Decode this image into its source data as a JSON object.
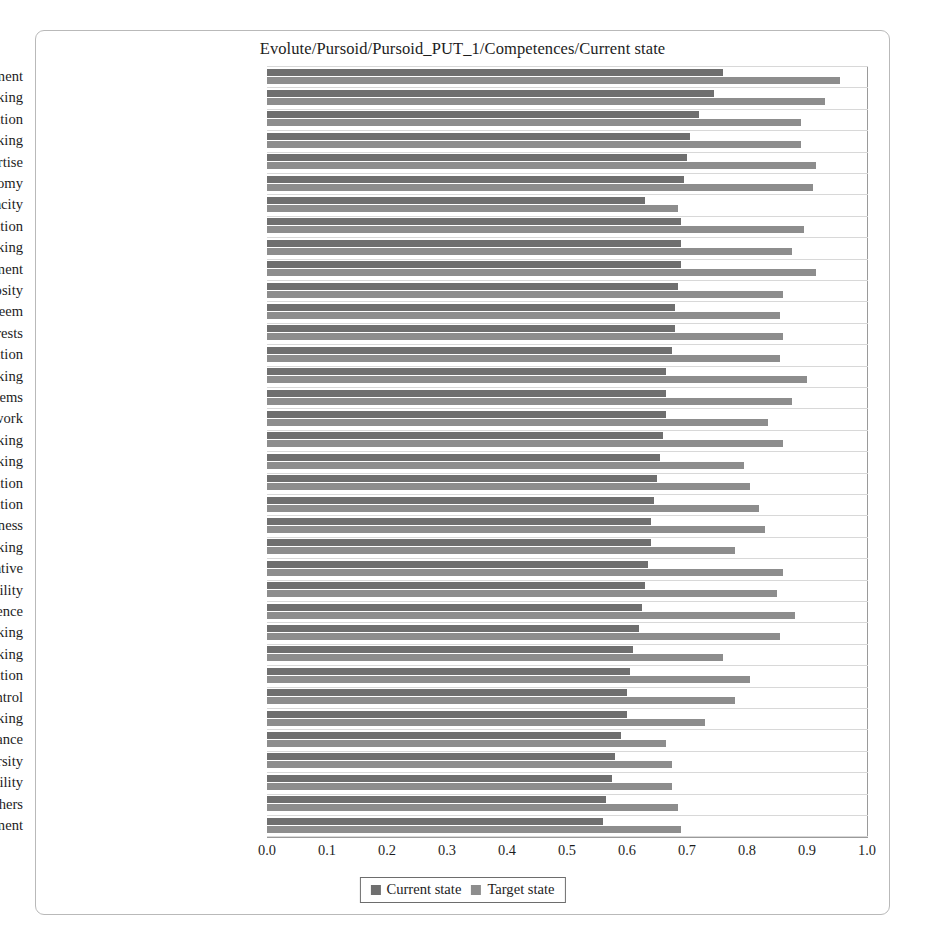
{
  "chart_title": "Evolute/Pursoid/Pursoid_PUT_1/Competences/Current state",
  "legend": {
    "items": [
      {
        "label": "Current state",
        "color": "#6f6f6f",
        "key": "current"
      },
      {
        "label": "Target state",
        "color": "#8d8d8d",
        "key": "target"
      }
    ]
  },
  "axis": {
    "ticks": [
      "0.0",
      "0.1",
      "0.2",
      "0.3",
      "0.4",
      "0.5",
      "0.6",
      "0.7",
      "0.8",
      "0.9",
      "1.0"
    ]
  },
  "chart_data": {
    "type": "bar",
    "orientation": "horizontal",
    "title": "Evolute/Pursoid/Pursoid_PUT_1/Competences/Current state",
    "xlabel": "",
    "ylabel": "",
    "xlim": [
      0.0,
      1.0
    ],
    "xticks": [
      0.0,
      0.1,
      0.2,
      0.3,
      0.4,
      0.5,
      0.6,
      0.7,
      0.8,
      0.9,
      1.0
    ],
    "grid": true,
    "legend_position": "bottom",
    "categories": [
      "Self-development",
      "Networking",
      "Achievement orientation",
      "Strategic thinking",
      "Occupational and technical expertise",
      "Autonomy",
      "Absorptive capacity",
      "Communication",
      "Risk taking",
      "Change management",
      "Curiosity",
      "Self-esteem",
      "Focus and interests",
      "Imagination",
      "Critical thinking",
      "Formulating problems",
      "Attitude to my work",
      "Lateral thinking",
      "Intuitive thinking",
      "Teamwork and cooperation",
      "Seeking information",
      "Trustworthiness",
      "Creative thinking",
      "Initiative",
      "Flexibility",
      "Self-confidence",
      "Analytical thinking",
      "Divergent thinking",
      "Observation",
      "Self-control",
      "Convergent thinking",
      "Stress tolerance",
      "Leveraging diversity",
      "Responsibility",
      "Understanding others",
      "Conflict management"
    ],
    "series": [
      {
        "name": "Current state",
        "color": "#6f6f6f",
        "values": [
          0.76,
          0.745,
          0.72,
          0.705,
          0.7,
          0.695,
          0.63,
          0.69,
          0.69,
          0.69,
          0.685,
          0.68,
          0.68,
          0.675,
          0.665,
          0.665,
          0.665,
          0.66,
          0.655,
          0.65,
          0.645,
          0.64,
          0.64,
          0.635,
          0.63,
          0.625,
          0.62,
          0.61,
          0.605,
          0.6,
          0.6,
          0.59,
          0.58,
          0.575,
          0.565,
          0.56
        ]
      },
      {
        "name": "Target state",
        "color": "#8d8d8d",
        "values": [
          0.955,
          0.93,
          0.89,
          0.89,
          0.915,
          0.91,
          0.685,
          0.895,
          0.875,
          0.915,
          0.86,
          0.855,
          0.86,
          0.855,
          0.9,
          0.875,
          0.835,
          0.86,
          0.795,
          0.805,
          0.82,
          0.83,
          0.78,
          0.86,
          0.85,
          0.88,
          0.855,
          0.76,
          0.805,
          0.78,
          0.73,
          0.665,
          0.675,
          0.675,
          0.685,
          0.69
        ]
      }
    ]
  }
}
